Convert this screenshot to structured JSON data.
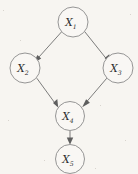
{
  "figure": {
    "kind": "directed-acyclic-graph",
    "title": "",
    "background_color": "#f7f5f1",
    "node_fill_color": "#f9f7f4",
    "node_stroke_color": "#8a8a8a",
    "edge_color": "#6e6e6e",
    "label_color": "#2b2b2b"
  },
  "graph_data": {
    "type": "diagram",
    "layout": "diamond",
    "nodes": [
      {
        "id": "X1",
        "base": "X",
        "subscript": "1",
        "label": "X₁",
        "cx": 73,
        "cy": 22,
        "r": 15
      },
      {
        "id": "X2",
        "base": "X",
        "subscript": "2",
        "label": "X₂",
        "cx": 25,
        "cy": 68,
        "r": 15
      },
      {
        "id": "X3",
        "base": "X",
        "subscript": "3",
        "label": "X₃",
        "cx": 118,
        "cy": 68,
        "r": 15
      },
      {
        "id": "X4",
        "base": "X",
        "subscript": "4",
        "label": "X₄",
        "cx": 70,
        "cy": 116,
        "r": 14.5
      },
      {
        "id": "X5",
        "base": "X",
        "subscript": "5",
        "label": "X₅",
        "cx": 70,
        "cy": 159,
        "r": 14.5
      }
    ],
    "edges": [
      {
        "from": "X1",
        "to": "X2",
        "directed": true
      },
      {
        "from": "X1",
        "to": "X3",
        "directed": true
      },
      {
        "from": "X2",
        "to": "X4",
        "directed": true
      },
      {
        "from": "X3",
        "to": "X4",
        "directed": true
      },
      {
        "from": "X4",
        "to": "X5",
        "directed": true
      }
    ]
  }
}
